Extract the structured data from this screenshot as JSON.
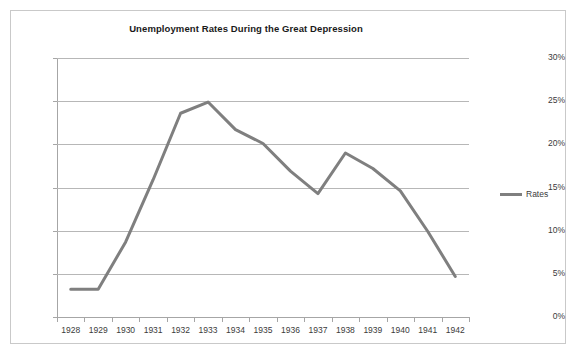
{
  "chart_data": {
    "type": "line",
    "title": "Unemployment Rates During the Great Depression",
    "xlabel": "",
    "ylabel": "",
    "categories": [
      "1928",
      "1929",
      "1930",
      "1931",
      "1932",
      "1933",
      "1934",
      "1935",
      "1936",
      "1937",
      "1938",
      "1939",
      "1940",
      "1941",
      "1942"
    ],
    "series": [
      {
        "name": "Rates",
        "color": "#7f7f7f",
        "values": [
          3.2,
          3.2,
          8.7,
          15.9,
          23.6,
          24.9,
          21.7,
          20.1,
          16.9,
          14.3,
          19.0,
          17.2,
          14.6,
          9.9,
          4.7
        ]
      }
    ],
    "ylim": [
      0,
      30
    ],
    "ytick_values": [
      0,
      5,
      10,
      15,
      20,
      25,
      30
    ],
    "ytick_labels": [
      "0%",
      "5%",
      "10%",
      "15%",
      "20%",
      "25%",
      "30%"
    ],
    "grid": true,
    "grid_axis": "y",
    "legend_position": "right",
    "legend_entries": [
      "Rates"
    ]
  },
  "colors": {
    "series_line": "#7f7f7f",
    "gridline": "#b7b7b7",
    "axis": "#a6a6a6",
    "text": "#3b3b3b",
    "title_text": "#1a1a1a",
    "frame_border": "#c9c9c9",
    "background": "#ffffff"
  }
}
